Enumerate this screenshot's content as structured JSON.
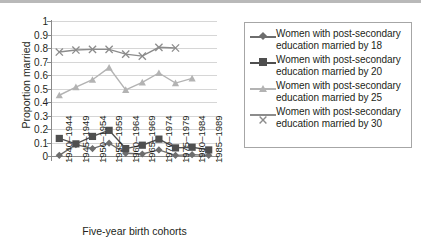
{
  "chart_data": {
    "type": "line",
    "title": "",
    "xlabel": "Five-year birth cohorts",
    "ylabel": "Proportion married",
    "ylim": [
      0,
      1
    ],
    "ytick_labels": [
      "1",
      "0.9",
      "0.8",
      "0.7",
      "0.6",
      "0.5",
      "0.4",
      "0.3",
      "0.2",
      "0.1",
      "0"
    ],
    "ytick_values": [
      1,
      0.9,
      0.8,
      0.7,
      0.6,
      0.5,
      0.4,
      0.3,
      0.2,
      0.1,
      0
    ],
    "grid": true,
    "legend_position": "right",
    "categories": [
      "1940–1944",
      "1945–1949",
      "1950–1954",
      "1955–1959",
      "1960–1964",
      "1965–1969",
      "1970–1974",
      "1975–1979",
      "1980–1984",
      "1985–1989"
    ],
    "series": [
      {
        "name": "Women with post-secondary education married by 18",
        "label_line1": "Women with post-secondary",
        "label_line2": "education married by 18",
        "marker": "diamond",
        "color": "#6d6d6d",
        "values": [
          0.005,
          0.085,
          0.055,
          0.095,
          0.02,
          0.015,
          0.045,
          0.005,
          0.01,
          0.005
        ]
      },
      {
        "name": "Women with post-secondary education married by 20",
        "label_line1": "Women with post-secondary",
        "label_line2": "education married by 20",
        "marker": "square",
        "color": "#4f4f4f",
        "values": [
          0.13,
          0.09,
          0.145,
          0.19,
          0.055,
          0.08,
          0.125,
          0.06,
          0.065,
          0.045
        ]
      },
      {
        "name": "Women with post-secondary education married by 25",
        "label_line1": "Women with post-secondary",
        "label_line2": "education married by 25",
        "marker": "triangle",
        "color": "#b3b3b3",
        "values": [
          0.45,
          0.51,
          0.565,
          0.655,
          0.49,
          0.545,
          0.615,
          0.54,
          0.575,
          null
        ]
      },
      {
        "name": "Women with post-secondary education married by 30",
        "label_line1": "Women with post-secondary",
        "label_line2": "education married by 30",
        "marker": "cross",
        "color": "#8c8c8c",
        "values": [
          0.77,
          0.785,
          0.79,
          0.79,
          0.755,
          0.74,
          0.805,
          0.8,
          null,
          null
        ]
      }
    ]
  }
}
